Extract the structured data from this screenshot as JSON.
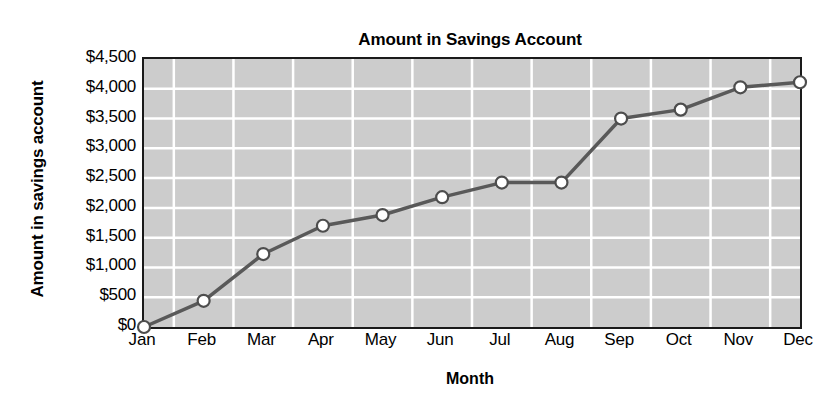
{
  "chart_data": {
    "type": "line",
    "title": "Amount in Savings Account",
    "xlabel": "Month",
    "ylabel": "Amount in savings account",
    "categories": [
      "Jan",
      "Feb",
      "Mar",
      "Apr",
      "May",
      "Jun",
      "Jul",
      "Aug",
      "Sep",
      "Oct",
      "Nov",
      "Dec"
    ],
    "values": [
      0,
      440,
      1225,
      1700,
      1880,
      2180,
      2425,
      2425,
      3500,
      3650,
      4025,
      4110
    ],
    "ylim": [
      0,
      4500
    ],
    "ytick_values": [
      0,
      500,
      1000,
      1500,
      2000,
      2500,
      3000,
      3500,
      4000,
      4500
    ],
    "ytick_labels": [
      "$0",
      "$500",
      "$1,000",
      "$1,500",
      "$2,000",
      "$2,500",
      "$3,000",
      "$3,500",
      "$4,000",
      "$4,500"
    ],
    "grid": true,
    "legend": null,
    "series": [
      {
        "name": "Amount in savings account",
        "values": [
          0,
          440,
          1225,
          1700,
          1880,
          2180,
          2425,
          2425,
          3500,
          3650,
          4025,
          4110
        ]
      }
    ],
    "style": {
      "plot_background": "#cccccc",
      "gridline_color": "#ffffff",
      "line_color": "#595959",
      "marker_fill": "#ffffff",
      "marker_edge": "#4d4d4d",
      "axis_color": "#1a1a1a",
      "text_color": "#000000",
      "page_background": "#ffffff"
    }
  }
}
